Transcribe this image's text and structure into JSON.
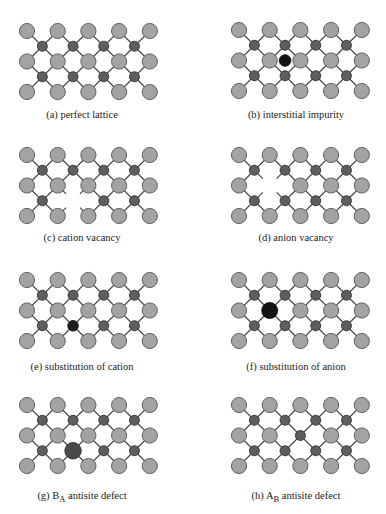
{
  "figure": {
    "colors": {
      "anion_fill": "#a3a3a3",
      "anion_stroke": "#555555",
      "cation_fill": "#5e5e5e",
      "cation_stroke": "#333333",
      "bond": "#444444",
      "impurity_fill": "#141414",
      "antisite_large_fill": "#4a4a4a"
    },
    "lattice": {
      "anion_columns": 5,
      "anion_rows": 3,
      "cation_columns": 4,
      "cation_rows": 2
    },
    "panels": [
      {
        "id": "a",
        "label_prefix": "(a) perfect lattice",
        "label_sub": "",
        "label_suffix": "",
        "defect": "none"
      },
      {
        "id": "b",
        "label_prefix": "(b) interstitial impurity",
        "label_sub": "",
        "label_suffix": "",
        "defect": "interstitial",
        "site": {
          "type": "cation-column",
          "col": 1,
          "row": 1
        }
      },
      {
        "id": "c",
        "label_prefix": "(c) cation vacancy",
        "label_sub": "",
        "label_suffix": "",
        "defect": "cation-vacancy",
        "site": {
          "type": "cation",
          "col": 1,
          "row": 1
        }
      },
      {
        "id": "d",
        "label_prefix": "(d) anion vacancy",
        "label_sub": "",
        "label_suffix": "",
        "defect": "anion-vacancy",
        "site": {
          "type": "anion",
          "col": 1,
          "row": 1
        }
      },
      {
        "id": "e",
        "label_prefix": "(e) substitution of cation",
        "label_sub": "",
        "label_suffix": "",
        "defect": "cation-substitution",
        "site": {
          "type": "cation",
          "col": 1,
          "row": 1
        }
      },
      {
        "id": "f",
        "label_prefix": "(f) substitution of anion",
        "label_sub": "",
        "label_suffix": "",
        "defect": "anion-substitution",
        "site": {
          "type": "anion",
          "col": 1,
          "row": 1
        }
      },
      {
        "id": "g",
        "label_prefix": "(g) B",
        "label_sub": "A",
        "label_suffix": " antisite defect",
        "defect": "antisite-BA",
        "site": {
          "type": "cation",
          "col": 1,
          "row": 1
        }
      },
      {
        "id": "h",
        "label_prefix": "(h) A",
        "label_sub": "B",
        "label_suffix": " antisite defect",
        "defect": "antisite-AB",
        "site": {
          "type": "anion",
          "col": 2,
          "row": 1
        }
      }
    ]
  }
}
